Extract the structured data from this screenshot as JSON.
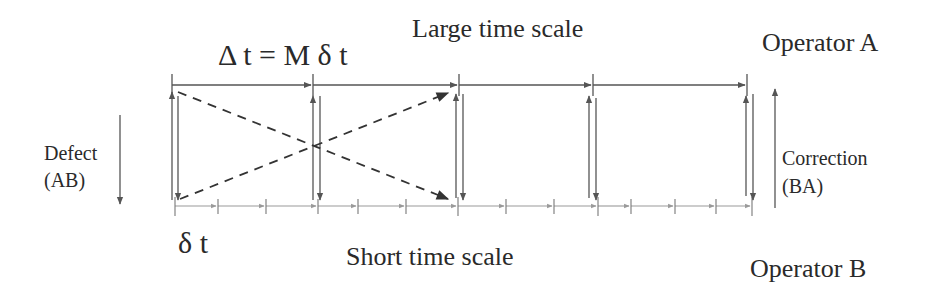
{
  "labels": {
    "delta_formula": "Δ t = M δ t",
    "large_time_scale": "Large time scale",
    "operator_a": "Operator A",
    "defect_line1": "Defect",
    "defect_line2": "(AB)",
    "correction_line1": "Correction",
    "correction_line2": "(BA)",
    "small_dt": "δ  t",
    "short_time_scale": "Short time scale",
    "operator_b": "Operator B"
  },
  "colors": {
    "line": "#555555",
    "fine_line": "#8a8a8a",
    "text": "#2a2a2a"
  },
  "timeline": {
    "large_ticks_x": [
      172,
      313,
      459,
      593,
      747
    ],
    "small_ticks_x": [
      175,
      218,
      266,
      318,
      358,
      406,
      458,
      506,
      554,
      598,
      631,
      675,
      716,
      752
    ],
    "top_y": 85,
    "bottom_y": 206
  }
}
